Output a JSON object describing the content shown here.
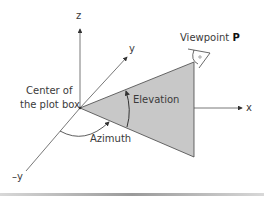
{
  "diagram": {
    "axes": {
      "z_label": "z",
      "y_label": "y",
      "neg_y_label": "–y",
      "x_label": "x"
    },
    "labels": {
      "center_line1": "Center of",
      "center_line2": "the plot box",
      "elevation": "Elevation",
      "azimuth": "Azimuth",
      "viewpoint_prefix": "Viewpoint ",
      "viewpoint_letter": "P"
    },
    "colors": {
      "triangle_fill": "#c8c8c8",
      "line": "#444444"
    }
  }
}
